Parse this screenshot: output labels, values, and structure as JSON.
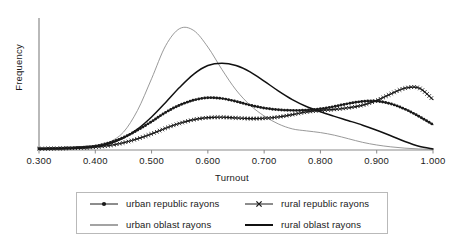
{
  "chart_data": {
    "type": "line",
    "title": "",
    "subtitle": "",
    "xlabel": "Turnout",
    "ylabel": "Frequency",
    "xlim": [
      0.3,
      1.0
    ],
    "ylim": [
      0,
      1.0
    ],
    "grid": false,
    "legend_position": "bottom",
    "xticks": [
      "0.300",
      "0.400",
      "0.500",
      "0.600",
      "0.700",
      "0.800",
      "0.900",
      "1.000"
    ],
    "xtick_values": [
      0.3,
      0.4,
      0.5,
      0.6,
      0.7,
      0.8,
      0.9,
      1.0
    ],
    "yticks": [],
    "x": [
      0.3,
      0.325,
      0.35,
      0.375,
      0.4,
      0.425,
      0.45,
      0.475,
      0.5,
      0.525,
      0.55,
      0.575,
      0.6,
      0.625,
      0.65,
      0.675,
      0.7,
      0.725,
      0.75,
      0.775,
      0.8,
      0.825,
      0.85,
      0.875,
      0.9,
      0.925,
      0.95,
      0.975,
      1.0
    ],
    "series": [
      {
        "name": "urban republic rayons",
        "marker": "dot",
        "color": "#1a1a1a",
        "values": [
          0.01,
          0.012,
          0.015,
          0.02,
          0.03,
          0.055,
          0.095,
          0.15,
          0.215,
          0.285,
          0.34,
          0.378,
          0.396,
          0.39,
          0.368,
          0.34,
          0.318,
          0.305,
          0.3,
          0.302,
          0.312,
          0.33,
          0.352,
          0.368,
          0.37,
          0.35,
          0.31,
          0.255,
          0.192
        ]
      },
      {
        "name": "rural republic rayons",
        "marker": "cross",
        "color": "#1a1a1a",
        "values": [
          0.01,
          0.011,
          0.013,
          0.016,
          0.022,
          0.034,
          0.055,
          0.085,
          0.122,
          0.165,
          0.202,
          0.23,
          0.245,
          0.248,
          0.243,
          0.238,
          0.24,
          0.25,
          0.268,
          0.288,
          0.3,
          0.308,
          0.32,
          0.34,
          0.375,
          0.425,
          0.468,
          0.47,
          0.382
        ]
      },
      {
        "name": "urban oblast rayons",
        "marker": "none",
        "color": "#8d8d8d",
        "values": [
          0.005,
          0.006,
          0.008,
          0.013,
          0.026,
          0.06,
          0.135,
          0.3,
          0.54,
          0.79,
          0.92,
          0.905,
          0.78,
          0.61,
          0.455,
          0.34,
          0.258,
          0.198,
          0.16,
          0.145,
          0.132,
          0.112,
          0.085,
          0.058,
          0.038,
          0.024,
          0.014,
          0.008,
          0.004
        ]
      },
      {
        "name": "rural oblast rayons",
        "marker": "none",
        "color": "#111111",
        "values": [
          0.008,
          0.009,
          0.011,
          0.016,
          0.026,
          0.048,
          0.09,
          0.158,
          0.25,
          0.36,
          0.475,
          0.575,
          0.64,
          0.658,
          0.64,
          0.592,
          0.522,
          0.448,
          0.382,
          0.33,
          0.29,
          0.255,
          0.222,
          0.188,
          0.15,
          0.108,
          0.064,
          0.028,
          0.008
        ]
      }
    ]
  },
  "axes": {
    "ylabel": "Frequency",
    "xlabel": "Turnout",
    "xticks": [
      {
        "label": "0.300",
        "value": 0.3
      },
      {
        "label": "0.400",
        "value": 0.4
      },
      {
        "label": "0.500",
        "value": 0.5
      },
      {
        "label": "0.600",
        "value": 0.6
      },
      {
        "label": "0.700",
        "value": 0.7
      },
      {
        "label": "0.800",
        "value": 0.8
      },
      {
        "label": "0.900",
        "value": 0.9
      },
      {
        "label": "1.000",
        "value": 1.0
      }
    ]
  },
  "legend": {
    "items": [
      {
        "label": "urban republic rayons",
        "marker": "dot-line",
        "color": "#1a1a1a"
      },
      {
        "label": "rural republic rayons",
        "marker": "cross-line",
        "color": "#1a1a1a"
      },
      {
        "label": "urban oblast rayons",
        "marker": "plain-line",
        "color": "#8d8d8d"
      },
      {
        "label": "rural oblast rayons",
        "marker": "plain-line",
        "color": "#111111"
      }
    ]
  },
  "colors": {
    "axis": "#8a8a8a",
    "text": "#1a1a1a",
    "legend_border": "#b9b9b9",
    "background": "#ffffff"
  }
}
